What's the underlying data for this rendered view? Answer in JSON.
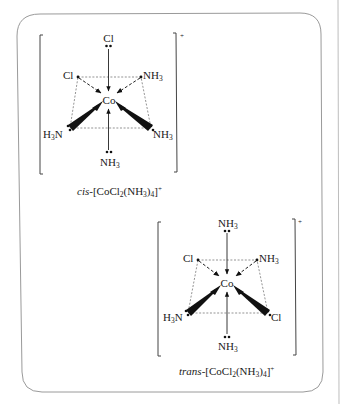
{
  "figure": {
    "frame_color": "#9a9a9a",
    "ink_color": "#1a1a1a"
  },
  "cis": {
    "charge": "+",
    "central_atom": "Co",
    "ligands": {
      "top": "Cl",
      "upper_left": "Cl",
      "upper_right": "NH",
      "upper_right_sub": "3",
      "lower_left_pre": "H",
      "lower_left_sub": "3",
      "lower_left_post": "N",
      "lower_right": "NH",
      "lower_right_sub": "3",
      "bottom": "NH",
      "bottom_sub": "3"
    },
    "caption": {
      "prefix": "cis",
      "dash": "-[CoCl",
      "sub1": "2",
      "mid": "(NH",
      "sub2": "3",
      "close": ")",
      "sub3": "4",
      "end": "]",
      "charge": "+"
    }
  },
  "trans": {
    "charge": "+",
    "central_atom": "Co",
    "ligands": {
      "top": "NH",
      "top_sub": "3",
      "upper_left": "Cl",
      "upper_right": "NH",
      "upper_right_sub": "3",
      "lower_left_pre": "H",
      "lower_left_sub": "3",
      "lower_left_post": "N",
      "lower_right": "Cl",
      "bottom": "NH",
      "bottom_sub": "3"
    },
    "caption": {
      "prefix": "trans",
      "dash": "-[CoCl",
      "sub1": "2",
      "mid": "(NH",
      "sub2": "3",
      "close": ")",
      "sub3": "4",
      "end": "]",
      "charge": "+"
    }
  }
}
